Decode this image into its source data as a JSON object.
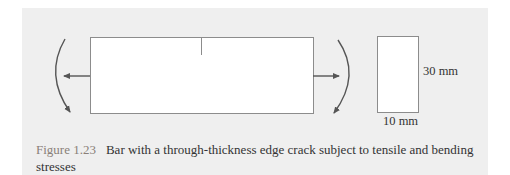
{
  "figure": {
    "number_label": "Figure 1.23",
    "caption": "Bar with a through-thickness edge crack subject to tensile and bending stresses",
    "dimensions": {
      "height_label": "30 mm",
      "width_label": "10 mm"
    },
    "colors": {
      "panel_background": "#efefef",
      "line": "#8c8c8c",
      "arrow": "#555555",
      "figure_number": "#8a7f78"
    }
  }
}
